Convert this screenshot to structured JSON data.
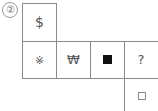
{
  "problem": {
    "number_label": "②"
  },
  "grid": {
    "top_cell": {
      "symbol": "$"
    },
    "row": [
      {
        "symbol": "※",
        "name": "asterisk-mark"
      },
      {
        "symbol": "₩",
        "name": "won-sign"
      },
      {
        "symbol": "■",
        "name": "black-square"
      },
      {
        "symbol": "?",
        "name": "question-mark"
      }
    ],
    "answer_cell": {
      "symbol": "□"
    }
  },
  "colors": {
    "line": "#8a8a8a",
    "text": "#555555",
    "filled_square": "#111111"
  }
}
